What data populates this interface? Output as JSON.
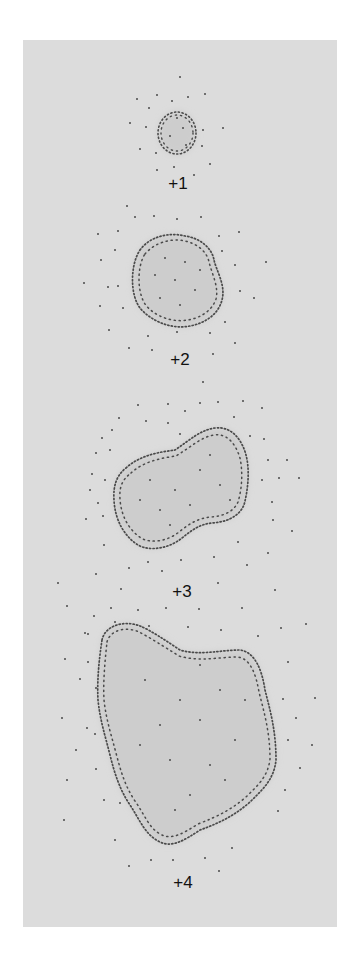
{
  "figure": {
    "background_color": "#dcdcdc",
    "blob_fill_color": "#cdcdcd",
    "dot_color": "#4a4a4a"
  },
  "stages": [
    {
      "label": "+1",
      "label_pos": [
        177,
        181
      ]
    },
    {
      "label": "+2",
      "label_pos": [
        179,
        357
      ]
    },
    {
      "label": "+3",
      "label_pos": [
        181,
        589
      ]
    },
    {
      "label": "+4",
      "label_pos": [
        182,
        880
      ]
    }
  ]
}
